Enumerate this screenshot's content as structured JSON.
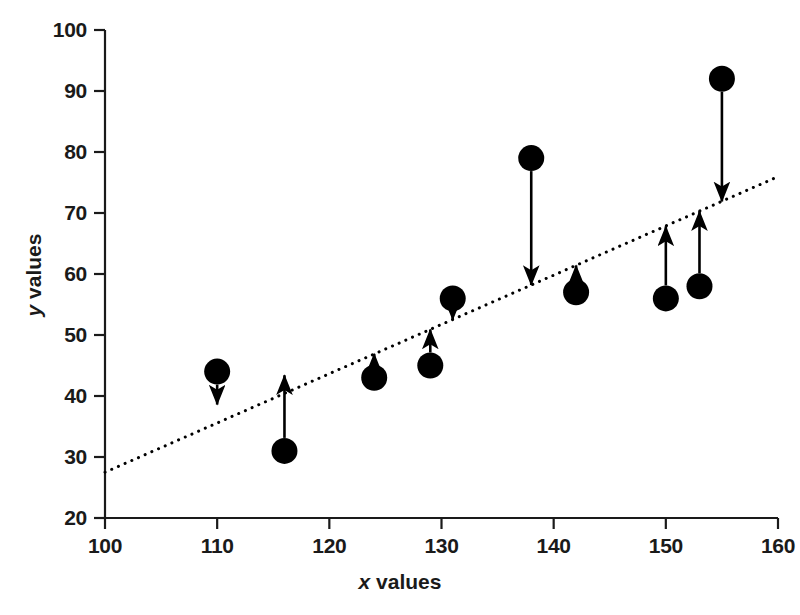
{
  "chart_data": {
    "type": "scatter",
    "title": "",
    "xlabel": "x values",
    "ylabel": "y values",
    "xlim": [
      100,
      160
    ],
    "ylim": [
      20,
      100
    ],
    "xticks": [
      100,
      110,
      120,
      130,
      140,
      150,
      160
    ],
    "yticks": [
      20,
      30,
      40,
      50,
      60,
      70,
      80,
      90,
      100
    ],
    "grid": false,
    "legend": null,
    "marker_color": "#000000",
    "line_color": "#000000",
    "arrow_color": "#000000",
    "x": [
      110,
      116,
      124,
      129,
      131,
      138,
      142,
      150,
      153,
      155
    ],
    "y": [
      44,
      31,
      43,
      45,
      56,
      79,
      57,
      56,
      58,
      92
    ],
    "points": [
      {
        "x": 110,
        "y": 44,
        "residual_end_y": 38.6,
        "direction": "down"
      },
      {
        "x": 116,
        "y": 31,
        "residual_end_y": 43.4,
        "direction": "up"
      },
      {
        "x": 124,
        "y": 43,
        "residual_end_y": 46.9,
        "direction": "up"
      },
      {
        "x": 129,
        "y": 45,
        "residual_end_y": 50.9,
        "direction": "up"
      },
      {
        "x": 131,
        "y": 56,
        "residual_end_y": 52.5,
        "direction": "down"
      },
      {
        "x": 138,
        "y": 79,
        "residual_end_y": 58.2,
        "direction": "down"
      },
      {
        "x": 142,
        "y": 57,
        "residual_end_y": 61.4,
        "direction": "up"
      },
      {
        "x": 150,
        "y": 56,
        "residual_end_y": 67.8,
        "direction": "up"
      },
      {
        "x": 153,
        "y": 58,
        "residual_end_y": 70.3,
        "direction": "up"
      },
      {
        "x": 155,
        "y": 92,
        "residual_end_y": 71.9,
        "direction": "down"
      }
    ],
    "fit_line": {
      "style": "dotted",
      "x_start": 100,
      "y_start": 27.5,
      "x_end": 159.8,
      "y_end": 75.8,
      "slope": 0.808,
      "intercept": -53.3
    },
    "annotations": [
      {
        "type": "residual-arrow",
        "count": 10,
        "description": "arrows from each data point to the fitted line"
      }
    ]
  }
}
